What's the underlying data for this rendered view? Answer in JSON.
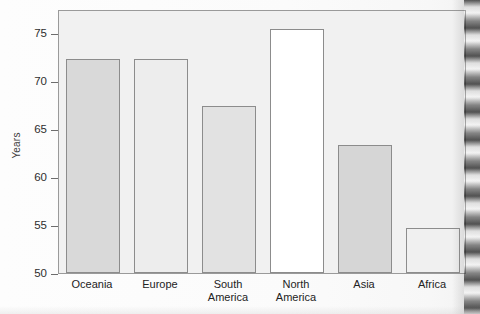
{
  "chart_data": {
    "type": "bar",
    "title": "",
    "xlabel": "",
    "ylabel": "Years",
    "ylim": [
      50,
      77.5
    ],
    "yticks": [
      50,
      55,
      60,
      65,
      70,
      75
    ],
    "ytick_labels": [
      "50",
      "55",
      "60",
      "65",
      "70",
      "75"
    ],
    "grid": false,
    "legend": "none",
    "categories": [
      "Oceania",
      "Europe",
      "South America",
      "North America",
      "Asia",
      "Africa"
    ],
    "category_lines": [
      [
        "Oceania"
      ],
      [
        "Europe"
      ],
      [
        "South",
        "America"
      ],
      [
        "North",
        "America"
      ],
      [
        "Asia"
      ],
      [
        "Africa"
      ]
    ],
    "values": [
      72.4,
      72.4,
      67.5,
      75.5,
      63.4,
      54.8
    ],
    "bar_fills": [
      "#d9d9d9",
      "#ededed",
      "#e2e2e2",
      "#ffffff",
      "#d6d6d6",
      "#f0f0f0"
    ],
    "bar_border_color": "#8c8c8c",
    "plot_background": "#f1f1f1",
    "axis_color": "#9a9a9a",
    "text_color": "#232323"
  },
  "figure": {
    "page_background": "#fcfcfc",
    "scan_artifact": "right-edge-binding-shadow"
  }
}
